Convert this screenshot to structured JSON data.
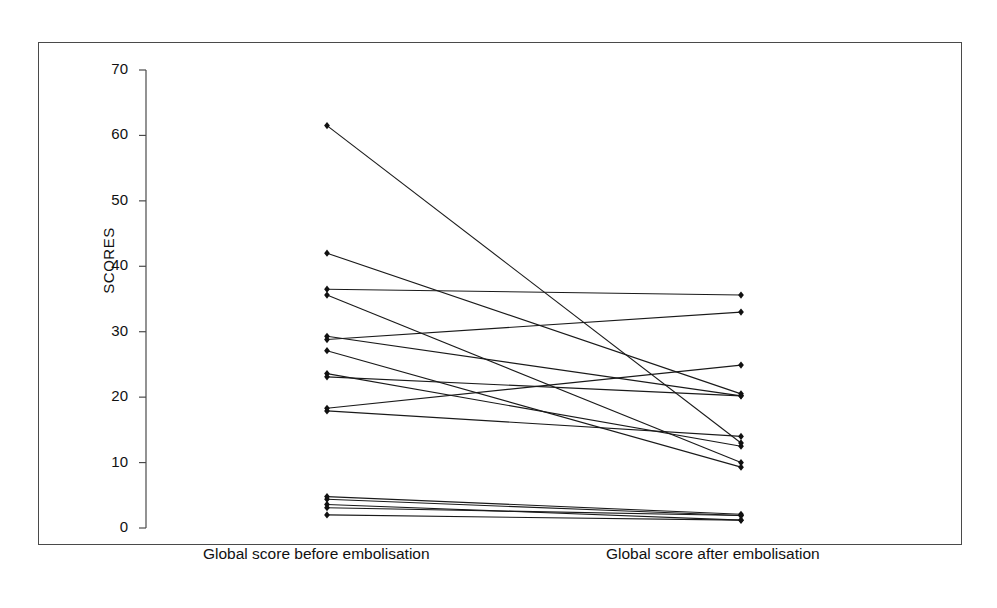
{
  "chart_data": {
    "type": "line",
    "title": "",
    "subtitle": "",
    "xlabel": "",
    "ylabel": "SCORES",
    "grid": false,
    "legend": "none",
    "categories": [
      "Global score before embolisation",
      "Global score after embolisation"
    ],
    "x": [
      0,
      1
    ],
    "xtick_labels": [
      "Global score before embolisation",
      "Global score after embolisation"
    ],
    "ylim": [
      0,
      70
    ],
    "ytick_values": [
      0,
      10,
      20,
      30,
      40,
      50,
      60,
      70
    ],
    "ytick_labels": [
      "0",
      "10",
      "20",
      "30",
      "40",
      "50",
      "60",
      "70"
    ],
    "marker": "diamond",
    "line_color": "#1a1a1a",
    "marker_color": "#111111",
    "series": [
      {
        "name": "patient-1",
        "values": [
          61.5,
          13.0
        ]
      },
      {
        "name": "patient-2",
        "values": [
          42.0,
          20.5
        ]
      },
      {
        "name": "patient-3",
        "values": [
          36.5,
          35.6
        ]
      },
      {
        "name": "patient-4",
        "values": [
          35.6,
          10.0
        ]
      },
      {
        "name": "patient-5",
        "values": [
          29.3,
          20.2
        ]
      },
      {
        "name": "patient-6",
        "values": [
          28.8,
          33.0
        ]
      },
      {
        "name": "patient-7",
        "values": [
          27.1,
          9.3
        ]
      },
      {
        "name": "patient-8",
        "values": [
          23.6,
          12.5
        ]
      },
      {
        "name": "patient-9",
        "values": [
          23.1,
          20.2
        ]
      },
      {
        "name": "patient-10",
        "values": [
          18.3,
          24.9
        ]
      },
      {
        "name": "patient-11",
        "values": [
          17.9,
          14.0
        ]
      },
      {
        "name": "patient-12",
        "values": [
          4.8,
          2.1
        ]
      },
      {
        "name": "patient-13",
        "values": [
          4.4,
          1.9
        ]
      },
      {
        "name": "patient-14",
        "values": [
          3.6,
          1.2
        ]
      },
      {
        "name": "patient-15",
        "values": [
          3.1,
          1.9
        ]
      },
      {
        "name": "patient-16",
        "values": [
          2.0,
          1.2
        ]
      }
    ]
  },
  "axis": {
    "y_title": "SCORES",
    "ticks": [
      "70",
      "60",
      "50",
      "40",
      "30",
      "20",
      "10",
      "0"
    ]
  },
  "xaxis": {
    "left_label": "Global score before embolisation",
    "right_label": "Global score after embolisation"
  }
}
